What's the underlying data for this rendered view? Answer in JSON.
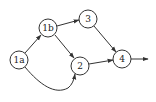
{
  "diagram": {
    "type": "directed-graph",
    "colors": {
      "stroke": "#333333",
      "text": "#222222",
      "background": "#ffffff"
    },
    "nodes": [
      {
        "id": "1a",
        "label": "1a",
        "x": 19,
        "y": 60
      },
      {
        "id": "1b",
        "label": "1b",
        "x": 48,
        "y": 28
      },
      {
        "id": "3",
        "label": "3",
        "x": 88,
        "y": 19
      },
      {
        "id": "2",
        "label": "2",
        "x": 80,
        "y": 66
      },
      {
        "id": "4",
        "label": "4",
        "x": 122,
        "y": 59
      }
    ],
    "edges": [
      {
        "from": "1a",
        "to": "1b"
      },
      {
        "from": "1b",
        "to": "3"
      },
      {
        "from": "1b",
        "to": "2"
      },
      {
        "from": "1a",
        "to": "2",
        "curved": true
      },
      {
        "from": "3",
        "to": "4"
      },
      {
        "from": "2",
        "to": "4"
      },
      {
        "from": "4",
        "to": "out"
      }
    ]
  }
}
